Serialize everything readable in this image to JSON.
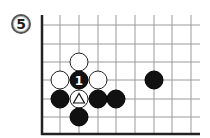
{
  "diagram": {
    "label": "5",
    "board": {
      "grid_x": [
        42,
        60,
        79,
        98,
        116,
        135,
        154,
        172,
        191
      ],
      "grid_y": [
        25,
        44,
        62,
        80,
        99,
        117,
        134
      ],
      "right_extent": 200,
      "top_extent": 15,
      "edges": [
        "left",
        "bottom"
      ],
      "line_color": "#9a9a9a",
      "edge_color": "#222222"
    },
    "stones": [
      {
        "color": "white",
        "col": 2,
        "row": 2,
        "mark": ""
      },
      {
        "color": "white",
        "col": 1,
        "row": 3,
        "mark": ""
      },
      {
        "color": "black",
        "col": 2,
        "row": 3,
        "mark": "1"
      },
      {
        "color": "white",
        "col": 3,
        "row": 3,
        "mark": ""
      },
      {
        "color": "black",
        "col": 1,
        "row": 4,
        "mark": ""
      },
      {
        "color": "white",
        "col": 2,
        "row": 4,
        "mark": "triangle"
      },
      {
        "color": "black",
        "col": 3,
        "row": 4,
        "mark": ""
      },
      {
        "color": "black",
        "col": 4,
        "row": 4,
        "mark": ""
      },
      {
        "color": "black",
        "col": 2,
        "row": 5,
        "mark": ""
      },
      {
        "color": "black",
        "col": 6,
        "row": 3,
        "mark": ""
      }
    ]
  }
}
